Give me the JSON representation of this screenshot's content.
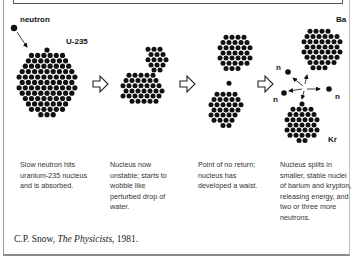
{
  "diagram": {
    "labels": {
      "neutron": "neutron",
      "uranium": "U-235",
      "barium": "Ba",
      "krypton": "Kr",
      "emitted_neutron": "n"
    },
    "stages": [
      {
        "id": 1,
        "caption": "Slow neutron hits uranium-235 nucleus and is absorbed."
      },
      {
        "id": 2,
        "caption": "Nucleus now unstable; starts to wobble like perturbed drop of water."
      },
      {
        "id": 3,
        "caption": "Point of no return; nucleus has developed a waist."
      },
      {
        "id": 4,
        "caption": "Nucleus splits in smaller, stable nuclei of barium and krypton, releasing energy, and two or three more neutrons."
      }
    ],
    "arrow_glyph": "hollow-right-arrow",
    "emitted_neutron_count": 4
  },
  "citation": {
    "author": "C.P. Snow, ",
    "work": "The Physicists",
    "year": ", 1981."
  }
}
